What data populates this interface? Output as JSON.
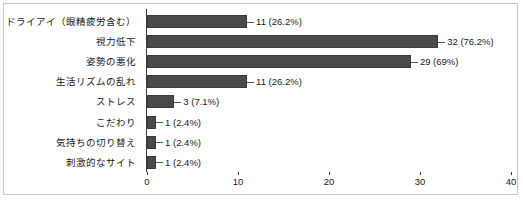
{
  "chart_data": {
    "type": "bar",
    "orientation": "horizontal",
    "title": "",
    "subtitle": "",
    "xlabel": "",
    "ylabel": "",
    "xlim": [
      0,
      40
    ],
    "grid": false,
    "legend": null,
    "bar_color": "#4a4a4a",
    "axis_color": "#3c3c3c",
    "frame_color": "#c9c9c9",
    "background": "#ffffff",
    "xticks": [
      "0",
      "10",
      "20",
      "30",
      "40"
    ],
    "xtick_values": [
      0,
      10,
      20,
      30,
      40
    ],
    "categories": [
      "ドライアイ（眼精疲労含む）",
      "視力低下",
      "姿勢の悪化",
      "生活リズムの乱れ",
      "ストレス",
      "こだわり",
      "気持ちの切り替え",
      "刺激的なサイト"
    ],
    "values": [
      11,
      32,
      29,
      11,
      3,
      1,
      1,
      1
    ],
    "percents": [
      "26.2%",
      "76.2%",
      "69%",
      "26.2%",
      "7.1%",
      "2.4%",
      "2.4%",
      "2.4%"
    ],
    "data_labels": [
      "11 (26.2%)",
      "32 (76.2%)",
      "29 (69%)",
      "11 (26.2%)",
      "3 (7.1%)",
      "1 (2.4%)",
      "1 (2.4%)",
      "1 (2.4%)"
    ]
  }
}
